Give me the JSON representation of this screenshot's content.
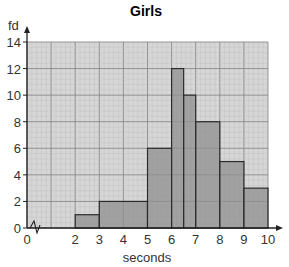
{
  "chart_data": {
    "type": "bar",
    "subtype": "histogram",
    "title": "Girls",
    "xlabel": "seconds",
    "ylabel": "fd",
    "xlim": [
      0,
      10
    ],
    "ylim": [
      0,
      14
    ],
    "x_ticks": [
      "0",
      "2",
      "3",
      "4",
      "5",
      "6",
      "7",
      "8",
      "9",
      "10"
    ],
    "y_ticks": [
      "0",
      "2",
      "4",
      "6",
      "8",
      "10",
      "12",
      "14"
    ],
    "x_axis_break": "zigzag between 0 and 2",
    "grid": true,
    "legend": null,
    "bins": [
      {
        "from": 2,
        "to": 3,
        "fd": 1
      },
      {
        "from": 3,
        "to": 5,
        "fd": 2
      },
      {
        "from": 5,
        "to": 6,
        "fd": 6
      },
      {
        "from": 6,
        "to": 6.5,
        "fd": 12
      },
      {
        "from": 6.5,
        "to": 7,
        "fd": 10
      },
      {
        "from": 7,
        "to": 8,
        "fd": 8
      },
      {
        "from": 8,
        "to": 9,
        "fd": 5
      },
      {
        "from": 9,
        "to": 10,
        "fd": 3
      }
    ],
    "categories": [
      "2-3",
      "3-5",
      "5-6",
      "6-6.5",
      "6.5-7",
      "7-8",
      "8-9",
      "9-10"
    ],
    "values": [
      1,
      2,
      6,
      12,
      10,
      8,
      5,
      3
    ]
  },
  "colors": {
    "grid_bg": "#d6d6d6",
    "grid_minor": "#bdbdbd",
    "grid_major": "#8a8a8a",
    "bar_fill": "#8f8f8f",
    "bar_stroke": "#2b2b2b",
    "axis": "#222222"
  }
}
